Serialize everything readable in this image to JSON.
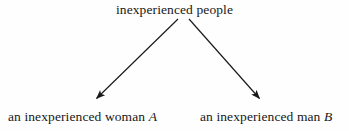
{
  "diagram": {
    "type": "tree",
    "orientation": "top-down",
    "background_color": "#fefefe",
    "ink_color": "#181818",
    "nodes": {
      "root": {
        "text": "inexperienced people",
        "role": "parent-category"
      },
      "left_child": {
        "text_main": "an inexperienced woman",
        "variable": "A",
        "role": "child-instance"
      },
      "right_child": {
        "text_main": "an inexperienced man",
        "variable": "B",
        "role": "child-instance"
      }
    },
    "edges": [
      {
        "name": "edge-root-to-left",
        "from": "root",
        "to": "left_child",
        "style": "solid",
        "arrowhead": "filled-triangle",
        "x1": 178,
        "y1": 19,
        "x2": 95,
        "y2": 100
      },
      {
        "name": "edge-root-to-right",
        "from": "root",
        "to": "right_child",
        "style": "solid",
        "arrowhead": "filled-triangle",
        "x1": 189,
        "y1": 19,
        "x2": 261,
        "y2": 100
      }
    ]
  }
}
